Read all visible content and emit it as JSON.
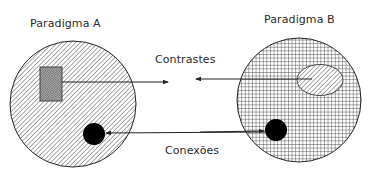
{
  "diagram": {
    "paradigm_a": {
      "label": "Paradigma A",
      "fill": "diagonal-hatch"
    },
    "paradigm_b": {
      "label": "Paradigma B",
      "fill": "grid-hatch"
    },
    "contrasts_label": "Contrastes",
    "connections_label": "Conexões",
    "colors": {
      "line": "#222222",
      "text": "#2a2a2a",
      "background": "#ffffff"
    }
  }
}
